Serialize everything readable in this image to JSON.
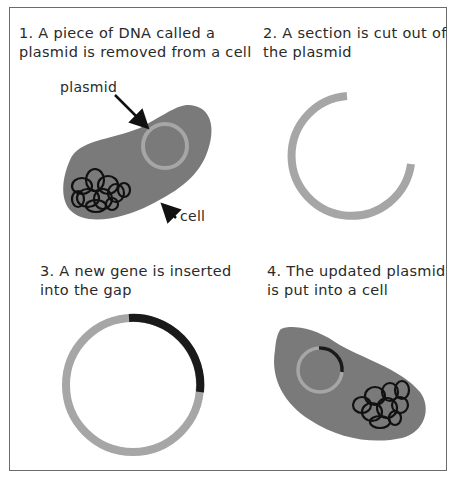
{
  "colors": {
    "cell_fill": "#7a7a7a",
    "plasmid": "#a6a6a6",
    "new_gene": "#1a1a1a",
    "chromosome": "#111111",
    "frame": "#6b6b6b"
  },
  "panels": [
    {
      "step": "1",
      "caption_line1": "1. A piece of DNA called a",
      "caption_line2": "plasmid is removed from a cell",
      "labels": {
        "plasmid": "plasmid",
        "cell": "cell"
      }
    },
    {
      "step": "2",
      "caption_line1": "2. A section is cut out of",
      "caption_line2": "the plasmid"
    },
    {
      "step": "3",
      "caption_line1": "3. A new gene is inserted",
      "caption_line2": "into the gap"
    },
    {
      "step": "4",
      "caption_line1": "4. The updated plasmid",
      "caption_line2": "is put into a cell"
    }
  ]
}
